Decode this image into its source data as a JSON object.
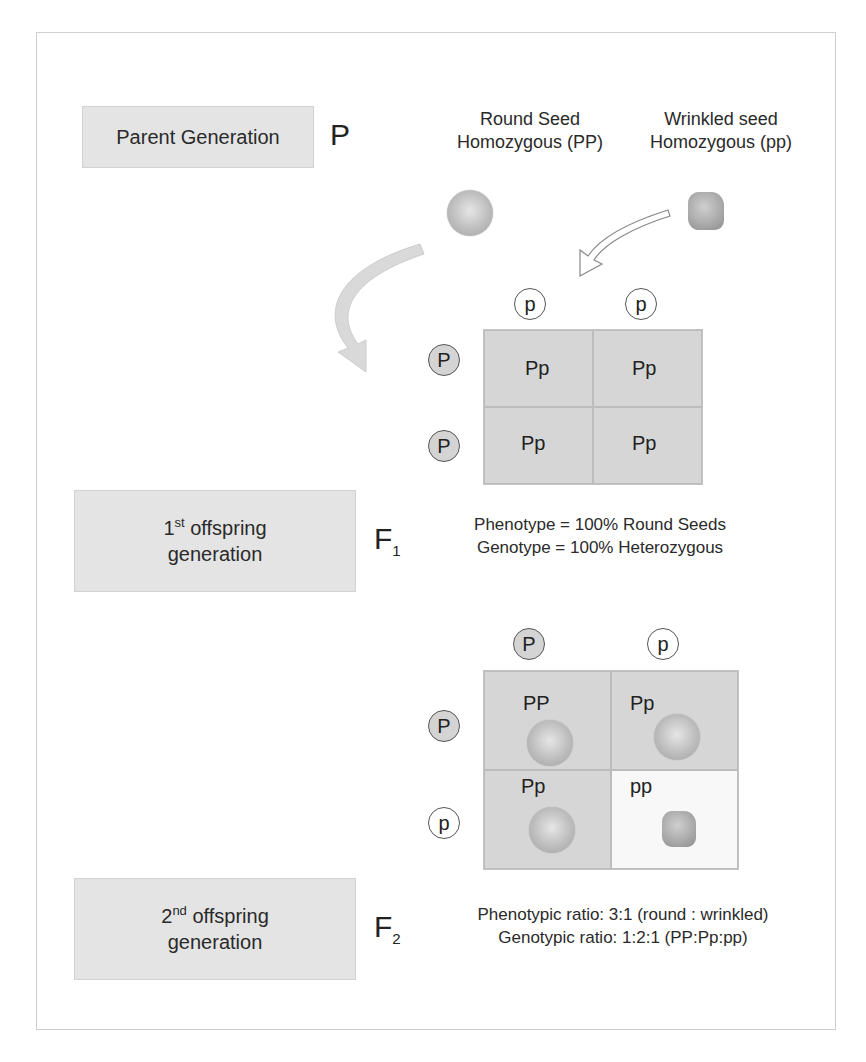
{
  "parent_generation": {
    "box_label": "Parent Generation",
    "symbol": "P",
    "round_seed": {
      "line1": "Round Seed",
      "line2": "Homozygous (PP)",
      "icon": "round-seed-icon"
    },
    "wrinkled_seed": {
      "line1": "Wrinkled seed",
      "line2": "Homozygous (pp)",
      "icon": "wrinkled-seed-icon"
    }
  },
  "f1_punnett": {
    "column_alleles": [
      "p",
      "p"
    ],
    "row_alleles": [
      "P",
      "P"
    ],
    "cells": [
      [
        "Pp",
        "Pp"
      ],
      [
        "Pp",
        "Pp"
      ]
    ]
  },
  "first_offspring": {
    "box_ordinal": "1",
    "box_suffix": "st",
    "box_line1_rest": " offspring",
    "box_line2": "generation",
    "symbol": "F",
    "symbol_sub": "1",
    "phenotype": "Phenotype = 100% Round Seeds",
    "genotype": "Genotype = 100% Heterozygous"
  },
  "f2_punnett": {
    "column_alleles": [
      "P",
      "p"
    ],
    "row_alleles": [
      "P",
      "p"
    ],
    "cells": [
      [
        {
          "genotype": "PP",
          "seed": "round"
        },
        {
          "genotype": "Pp",
          "seed": "round"
        }
      ],
      [
        {
          "genotype": "Pp",
          "seed": "round"
        },
        {
          "genotype": "pp",
          "seed": "wrinkled"
        }
      ]
    ]
  },
  "second_offspring": {
    "box_ordinal": "2",
    "box_suffix": "nd",
    "box_line1_rest": " offspring",
    "box_line2": "generation",
    "symbol": "F",
    "symbol_sub": "2",
    "phenotypic_ratio": "Phenotypic ratio: 3:1 (round : wrinkled)",
    "genotypic_ratio": "Genotypic ratio: 1:2:1 (PP:Pp:pp)"
  },
  "colors": {
    "box_fill": "#e4e4e4",
    "cell_fill": "#d6d6d6",
    "recessive_cell_fill": "#f8f8f8",
    "arrow_fill": "#d9d9d9"
  }
}
